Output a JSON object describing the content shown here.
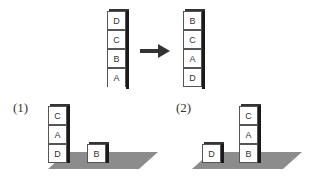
{
  "diagram": {
    "initial_stack": {
      "top_to_bottom": [
        "D",
        "C",
        "B",
        "A"
      ]
    },
    "goal_stack": {
      "top_to_bottom": [
        "B",
        "C",
        "A",
        "D"
      ]
    },
    "arrow": "right-arrow",
    "states": [
      {
        "label": "(1)",
        "stacks": [
          {
            "top_to_bottom": [
              "C",
              "A",
              "D"
            ]
          },
          {
            "top_to_bottom": [
              "B"
            ]
          }
        ]
      },
      {
        "label": "(2)",
        "stacks": [
          {
            "top_to_bottom": [
              "D"
            ]
          },
          {
            "top_to_bottom": [
              "C",
              "A",
              "B"
            ]
          }
        ]
      }
    ],
    "colors": {
      "floor": "#8c8c8c",
      "cube_side": "#1a1a1a",
      "cube_face": "#ffffff"
    }
  }
}
